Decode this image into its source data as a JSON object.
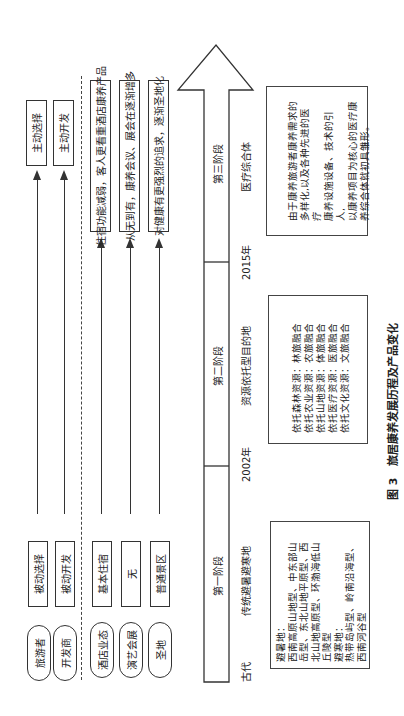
{
  "figure": {
    "caption_num": "图 3",
    "caption_text": "旅居康养发展历程及产品变化"
  },
  "timeline": {
    "stages": [
      {
        "label": "第一阶段",
        "type": "传统避暑避寒地",
        "start": "古代"
      },
      {
        "label": "第二阶段",
        "type": "资源依托型目的地",
        "start": "2002年"
      },
      {
        "label": "第三阶段",
        "type": "医疗综合体",
        "start": "2015年"
      }
    ]
  },
  "actors": [
    {
      "name": "旅游者",
      "before": "被动选择",
      "after": "主动选择"
    },
    {
      "name": "开发商",
      "before": "被动开发",
      "after": "主动开发"
    }
  ],
  "products": [
    {
      "name": "酒店业态",
      "before": "基本住宿",
      "after": "住宿功能减弱，客人更看重酒店康养产品"
    },
    {
      "name": "演艺会展",
      "before": "无",
      "after": "从无到有，康养会议、展会在逐渐增多"
    },
    {
      "name": "圣地",
      "before": "普通景区",
      "after": "对健康有更强烈的追求，逐渐圣地化"
    }
  ],
  "descriptions": {
    "stage1": [
      "避暑地：",
      "西南高原山地型、中东部山",
      "岳型、东北山地平原型、西",
      "北山地高原型、环渤海低山",
      "丘陵型",
      "避寒地：",
      "热带岛屿型、岭南沿海型、",
      "西南河谷型"
    ],
    "stage2": [
      "依托森林资源：林旅融合",
      "依托农业资源：农旅融合",
      "依托山地资源：体旅融合",
      "依托医疗资源：医旅融合",
      "依托文化资源：文旅融合"
    ],
    "stage3": [
      "由于康养旅游者康养需求的",
      "多样化,以及各种先进的医疗",
      "康养设施设备、技术的引人,",
      "以康养项目为核心的医疗康",
      "养综合体就初具雏形。"
    ]
  }
}
